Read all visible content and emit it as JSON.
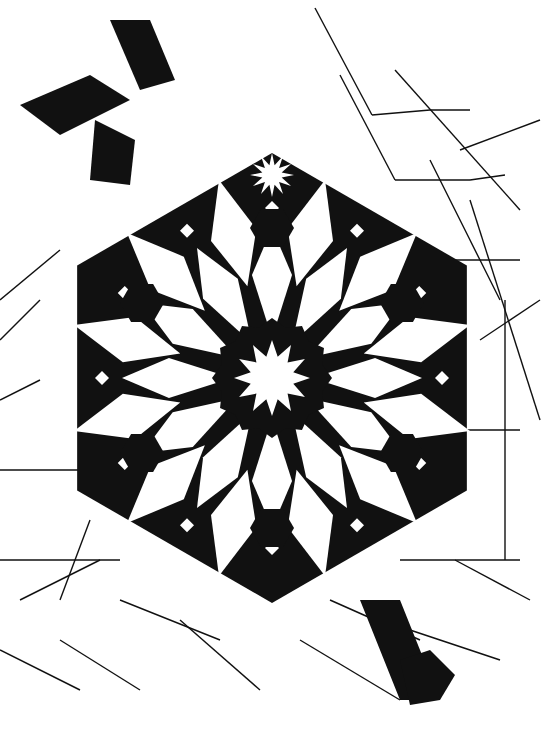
{
  "figure": {
    "subject": "Islamic geometric star pattern",
    "style": "black interlace band with outline construction lines",
    "center_motif": "12-point star",
    "secondary_motifs": [
      "hexagons",
      "small squares",
      "kite petals"
    ],
    "colors": {
      "ink": "#111111",
      "background": "#ffffff"
    },
    "center": [
      272,
      378
    ]
  }
}
